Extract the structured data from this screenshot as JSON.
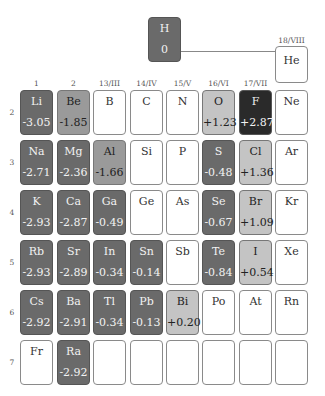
{
  "group_labels": [
    "1",
    "2",
    "13/III",
    "14/IV",
    "15/V",
    "16/VI",
    "17/VII",
    "18/VIII"
  ],
  "period_labels": [
    "2",
    "3",
    "4",
    "5",
    "6",
    "7"
  ],
  "shade_colors": {
    "dark": "#6a6a6a",
    "medium": "#9a9a9a",
    "light": "#c4c4c4",
    "black": "#2a2a2a",
    "empty": "#ffffff"
  },
  "hydrogen": {
    "symbol": "H",
    "value": "0",
    "shade": "dark"
  },
  "helium": {
    "symbol": "He",
    "value": "",
    "shade": "empty"
  },
  "rows": [
    {
      "period": "2",
      "cells": [
        {
          "symbol": "Li",
          "value": "-3.05",
          "shade": "dark"
        },
        {
          "symbol": "Be",
          "value": "-1.85",
          "shade": "medium"
        },
        {
          "symbol": "B",
          "value": "",
          "shade": "empty"
        },
        {
          "symbol": "C",
          "value": "",
          "shade": "empty"
        },
        {
          "symbol": "N",
          "value": "",
          "shade": "empty"
        },
        {
          "symbol": "O",
          "value": "+1.23",
          "shade": "light"
        },
        {
          "symbol": "F",
          "value": "+2.87",
          "shade": "black"
        },
        {
          "symbol": "Ne",
          "value": "",
          "shade": "empty"
        }
      ]
    },
    {
      "period": "3",
      "cells": [
        {
          "symbol": "Na",
          "value": "-2.71",
          "shade": "dark"
        },
        {
          "symbol": "Mg",
          "value": "-2.36",
          "shade": "dark"
        },
        {
          "symbol": "Al",
          "value": "-1.66",
          "shade": "medium"
        },
        {
          "symbol": "Si",
          "value": "",
          "shade": "empty"
        },
        {
          "symbol": "P",
          "value": "",
          "shade": "empty"
        },
        {
          "symbol": "S",
          "value": "-0.48",
          "shade": "dark"
        },
        {
          "symbol": "Cl",
          "value": "+1.36",
          "shade": "light"
        },
        {
          "symbol": "Ar",
          "value": "",
          "shade": "empty"
        }
      ]
    },
    {
      "period": "4",
      "cells": [
        {
          "symbol": "K",
          "value": "-2.93",
          "shade": "dark"
        },
        {
          "symbol": "Ca",
          "value": "-2.87",
          "shade": "dark"
        },
        {
          "symbol": "Ga",
          "value": "-0.49",
          "shade": "dark"
        },
        {
          "symbol": "Ge",
          "value": "",
          "shade": "empty"
        },
        {
          "symbol": "As",
          "value": "",
          "shade": "empty"
        },
        {
          "symbol": "Se",
          "value": "-0.67",
          "shade": "dark"
        },
        {
          "symbol": "Br",
          "value": "+1.09",
          "shade": "light"
        },
        {
          "symbol": "Kr",
          "value": "",
          "shade": "empty"
        }
      ]
    },
    {
      "period": "5",
      "cells": [
        {
          "symbol": "Rb",
          "value": "-2.93",
          "shade": "dark"
        },
        {
          "symbol": "Sr",
          "value": "-2.89",
          "shade": "dark"
        },
        {
          "symbol": "In",
          "value": "-0.34",
          "shade": "dark"
        },
        {
          "symbol": "Sn",
          "value": "-0.14",
          "shade": "dark"
        },
        {
          "symbol": "Sb",
          "value": "",
          "shade": "empty"
        },
        {
          "symbol": "Te",
          "value": "-0.84",
          "shade": "dark"
        },
        {
          "symbol": "I",
          "value": "+0.54",
          "shade": "light"
        },
        {
          "symbol": "Xe",
          "value": "",
          "shade": "empty"
        }
      ]
    },
    {
      "period": "6",
      "cells": [
        {
          "symbol": "Cs",
          "value": "-2.92",
          "shade": "dark"
        },
        {
          "symbol": "Ba",
          "value": "-2.91",
          "shade": "dark"
        },
        {
          "symbol": "Tl",
          "value": "-0.34",
          "shade": "dark"
        },
        {
          "symbol": "Pb",
          "value": "-0.13",
          "shade": "dark"
        },
        {
          "symbol": "Bi",
          "value": "+0.20",
          "shade": "light"
        },
        {
          "symbol": "Po",
          "value": "",
          "shade": "empty"
        },
        {
          "symbol": "At",
          "value": "",
          "shade": "empty"
        },
        {
          "symbol": "Rn",
          "value": "",
          "shade": "empty"
        }
      ]
    },
    {
      "period": "7",
      "cells": [
        {
          "symbol": "Fr",
          "value": "",
          "shade": "empty"
        },
        {
          "symbol": "Ra",
          "value": "-2.92",
          "shade": "dark"
        },
        {
          "symbol": "",
          "value": "",
          "shade": "empty"
        },
        {
          "symbol": "",
          "value": "",
          "shade": "empty"
        },
        {
          "symbol": "",
          "value": "",
          "shade": "empty"
        },
        {
          "symbol": "",
          "value": "",
          "shade": "empty"
        },
        {
          "symbol": "",
          "value": "",
          "shade": "empty"
        },
        {
          "symbol": "",
          "value": "",
          "shade": "empty"
        }
      ]
    }
  ]
}
